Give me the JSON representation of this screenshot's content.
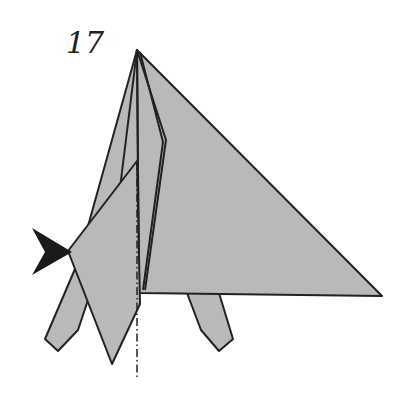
{
  "diagram": {
    "step_number": "17",
    "colors": {
      "paper": "#b9b9b9",
      "outline": "#222222",
      "arrow": "#1a1a1a",
      "background": "#ffffff"
    },
    "elements": {
      "model": "origami-model",
      "push_arrow": "push-arrow",
      "fold_line": "mountain-fold-line"
    }
  }
}
